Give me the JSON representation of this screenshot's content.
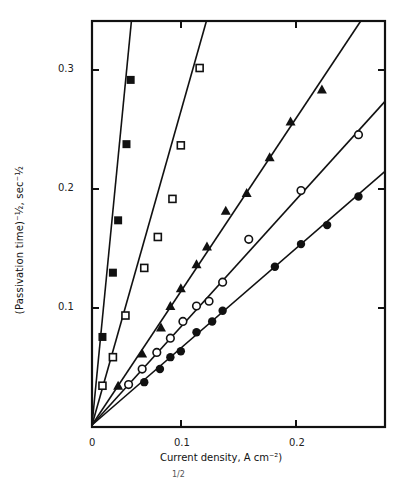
{
  "chart_data": {
    "type": "scatter",
    "title": "",
    "xlabel": "Current density, A cm⁻²)",
    "ylabel": "(Passivation time)⁻½, sec⁻½",
    "xlim": [
      0,
      0.28
    ],
    "ylim": [
      0,
      0.34
    ],
    "x_ticks": [
      "0",
      "0.1",
      "0.2"
    ],
    "y_ticks": [
      "0.1",
      "0.2",
      "0.3"
    ],
    "grid": false,
    "legend": null,
    "series": [
      {
        "name": "filled squares",
        "marker": "filled-square",
        "fit_slope": 9.0,
        "points": [
          [
            0.01,
            0.074
          ],
          [
            0.02,
            0.128
          ],
          [
            0.025,
            0.172
          ],
          [
            0.033,
            0.236
          ],
          [
            0.037,
            0.29
          ]
        ]
      },
      {
        "name": "open squares",
        "marker": "open-square",
        "fit_slope": 3.1,
        "points": [
          [
            0.01,
            0.033
          ],
          [
            0.02,
            0.057
          ],
          [
            0.032,
            0.092
          ],
          [
            0.05,
            0.132
          ],
          [
            0.063,
            0.158
          ],
          [
            0.077,
            0.19
          ],
          [
            0.085,
            0.235
          ],
          [
            0.103,
            0.3
          ]
        ]
      },
      {
        "name": "filled triangles",
        "marker": "filled-triangle",
        "fit_slope": 1.32,
        "points": [
          [
            0.025,
            0.033
          ],
          [
            0.048,
            0.06
          ],
          [
            0.066,
            0.082
          ],
          [
            0.075,
            0.1
          ],
          [
            0.085,
            0.115
          ],
          [
            0.1,
            0.135
          ],
          [
            0.11,
            0.15
          ],
          [
            0.128,
            0.18
          ],
          [
            0.148,
            0.195
          ],
          [
            0.17,
            0.225
          ],
          [
            0.19,
            0.255
          ],
          [
            0.22,
            0.282
          ]
        ]
      },
      {
        "name": "open circles",
        "marker": "open-circle",
        "fit_slope": 0.97,
        "points": [
          [
            0.035,
            0.034
          ],
          [
            0.048,
            0.047
          ],
          [
            0.062,
            0.061
          ],
          [
            0.075,
            0.073
          ],
          [
            0.087,
            0.087
          ],
          [
            0.1,
            0.1
          ],
          [
            0.112,
            0.104
          ],
          [
            0.125,
            0.12
          ],
          [
            0.15,
            0.156
          ],
          [
            0.2,
            0.197
          ],
          [
            0.255,
            0.244
          ]
        ]
      },
      {
        "name": "filled circles",
        "marker": "filled-circle",
        "fit_slope": 0.76,
        "points": [
          [
            0.05,
            0.036
          ],
          [
            0.065,
            0.047
          ],
          [
            0.075,
            0.057
          ],
          [
            0.085,
            0.062
          ],
          [
            0.1,
            0.078
          ],
          [
            0.115,
            0.087
          ],
          [
            0.125,
            0.096
          ],
          [
            0.175,
            0.133
          ],
          [
            0.2,
            0.152
          ],
          [
            0.225,
            0.168
          ],
          [
            0.255,
            0.192
          ]
        ]
      }
    ]
  },
  "labels": {
    "ylabel": "(Passivation time)⁻½, sec⁻½",
    "xlabel": "Current density, A cm⁻²)",
    "footnote": "1/2",
    "tick_x0": "0",
    "tick_x1": "0.1",
    "tick_x2": "0.2",
    "tick_y1": "0.1",
    "tick_y2": "0.2",
    "tick_y3": "0.3"
  }
}
